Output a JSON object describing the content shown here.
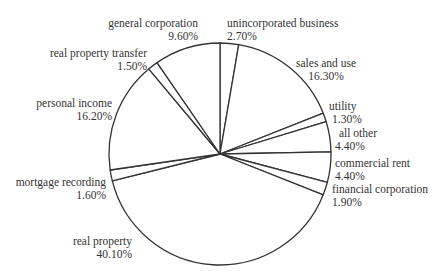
{
  "chart_data": {
    "type": "pie",
    "title": "",
    "start_angle_deg": 0,
    "direction": "clockwise",
    "slices": [
      {
        "label": "unincorporated business",
        "value": 2.7,
        "text": "2.70%"
      },
      {
        "label": "sales and use",
        "value": 16.3,
        "text": "16.30%"
      },
      {
        "label": "utility",
        "value": 1.3,
        "text": "1.30%"
      },
      {
        "label": "all other",
        "value": 4.4,
        "text": "4.40%"
      },
      {
        "label": "commercial rent",
        "value": 4.4,
        "text": "4.40%"
      },
      {
        "label": "financial corporation",
        "value": 1.9,
        "text": "1.90%"
      },
      {
        "label": "real property",
        "value": 40.1,
        "text": "40.10%"
      },
      {
        "label": "mortgage recording",
        "value": 1.6,
        "text": "1.60%"
      },
      {
        "label": "personal income",
        "value": 16.2,
        "text": "16.20%"
      },
      {
        "label": "real property transfer",
        "value": 1.5,
        "text": "1.50%"
      },
      {
        "label": "general corporation",
        "value": 9.6,
        "text": "9.60%"
      }
    ],
    "legend": "none",
    "fill": "#ffffff",
    "stroke": "#333333"
  }
}
